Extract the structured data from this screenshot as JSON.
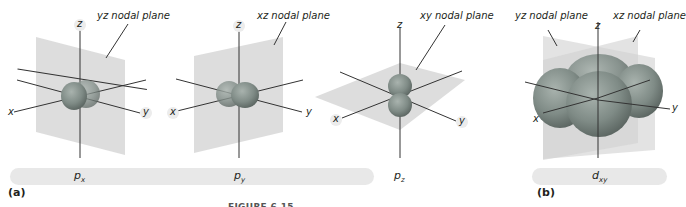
{
  "figure": {
    "panel_a": {
      "letter": "(a)",
      "bar_color": "#e8e8e8",
      "orbitals": [
        {
          "name": "p",
          "subscript": "x",
          "nodal_plane_label": "yz nodal plane"
        },
        {
          "name": "p",
          "subscript": "y",
          "nodal_plane_label": "xz nodal plane"
        },
        {
          "name": "p",
          "subscript": "z",
          "nodal_plane_label": "xy nodal plane"
        }
      ]
    },
    "panel_b": {
      "letter": "(b)",
      "orbital": {
        "name": "d",
        "subscript": "xy"
      },
      "nodal_plane_labels": [
        "yz nodal plane",
        "xz nodal plane"
      ]
    },
    "axis_labels": {
      "x": "x",
      "y": "y",
      "z": "z"
    },
    "colors": {
      "plane": "#d9d9d9",
      "lobe": "#7f8b86",
      "lobe_dark": "#5d6863",
      "axis": "#333333"
    },
    "caption_truncated": "FIGURE 6.15 ..."
  }
}
